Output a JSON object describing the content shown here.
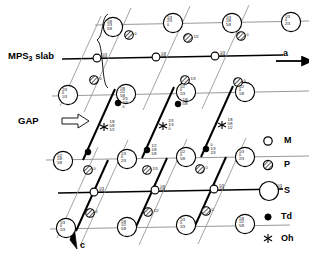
{
  "figure": {
    "kind": "crystal-structure-projection",
    "annotations": {
      "slab_label": "MPS",
      "slab_label_sub": "3",
      "slab_label_tail": " slab",
      "gap_label": "GAP",
      "gap_arrow": "⟹",
      "axis_a": "a",
      "axis_c": "c"
    },
    "legend": {
      "title": "",
      "items": [
        {
          "key": "M",
          "label": "M",
          "symbol": "small-open-circle"
        },
        {
          "key": "P",
          "label": "P",
          "symbol": "hatched-circle"
        },
        {
          "key": "S",
          "label": "S",
          "symbol": "large-open-circle"
        },
        {
          "key": "Td",
          "label": "Td",
          "symbol": "small-filled-dot"
        },
        {
          "key": "Oh",
          "label": "Oh",
          "symbol": "asterisk"
        }
      ]
    },
    "colors": {
      "ink": "#000000",
      "paper": "#ffffff",
      "grid_light": "#8a8a8a",
      "grid_heavy": "#000000"
    },
    "sites": {
      "S_large": [
        {
          "id": "S1",
          "x": 113,
          "y": 27,
          "lines": [
            "1/8",
            "1/3",
            "5/8"
          ]
        },
        {
          "id": "S2",
          "x": 173,
          "y": 23,
          "lines": [
            "1/3",
            "2/3",
            "0"
          ]
        },
        {
          "id": "S3",
          "x": 232,
          "y": 23,
          "lines": [
            "1/3",
            "1/8",
            "5/8"
          ]
        },
        {
          "id": "S4",
          "x": 291,
          "y": 22,
          "lines": [
            "1/3",
            "0",
            "2/3"
          ]
        },
        {
          "id": "S5",
          "x": 68,
          "y": 95,
          "lines": [
            "2/3",
            "0",
            "1/3"
          ]
        },
        {
          "id": "S6",
          "x": 126,
          "y": 94,
          "lines": [
            "1/8",
            "1/2",
            "5/8"
          ]
        },
        {
          "id": "S7",
          "x": 186,
          "y": 92,
          "lines": [
            "1/2",
            "0",
            "2/3"
          ]
        },
        {
          "id": "S8",
          "x": 245,
          "y": 92,
          "lines": [
            "1/2",
            "0",
            "1/8"
          ]
        },
        {
          "id": "S9",
          "x": 63,
          "y": 161,
          "lines": [
            "1/2",
            "1/8",
            "5/8"
          ]
        },
        {
          "id": "S10",
          "x": 127,
          "y": 159,
          "lines": [
            "1/3",
            "0",
            "2/3"
          ]
        },
        {
          "id": "S11",
          "x": 186,
          "y": 157,
          "lines": [
            "1/2",
            "0",
            "5/8"
          ]
        },
        {
          "id": "S12",
          "x": 245,
          "y": 157,
          "lines": [
            "1/3",
            "0",
            "2/3"
          ]
        },
        {
          "id": "S13",
          "x": 66,
          "y": 228,
          "lines": [
            "1/3",
            "0",
            "2/3"
          ]
        },
        {
          "id": "S14",
          "x": 127,
          "y": 227,
          "lines": [
            "1/8",
            "1/2",
            "5/8"
          ]
        },
        {
          "id": "S15",
          "x": 186,
          "y": 225,
          "lines": [
            "1/3",
            "0",
            "2/3"
          ]
        },
        {
          "id": "S16",
          "x": 245,
          "y": 224,
          "lines": [
            "1/8",
            "1/2",
            "5/8"
          ]
        }
      ],
      "M_small": [
        {
          "id": "M1",
          "x": 97,
          "y": 58,
          "lines": [
            "1/3",
            "2/3"
          ]
        },
        {
          "id": "M2",
          "x": 156,
          "y": 57,
          "lines": [
            "1/8",
            "5/8"
          ]
        },
        {
          "id": "M3",
          "x": 215,
          "y": 56,
          "lines": [
            "1/3",
            "2/3"
          ]
        },
        {
          "id": "M4",
          "x": 94,
          "y": 192,
          "lines": [
            "1/3",
            "2/3"
          ]
        },
        {
          "id": "M5",
          "x": 155,
          "y": 190,
          "lines": [
            "1/8",
            "5/8"
          ]
        },
        {
          "id": "M6",
          "x": 214,
          "y": 189,
          "lines": [
            "1/3",
            "2/3"
          ]
        },
        {
          "id": "M7",
          "x": 272,
          "y": 189,
          "lines": [
            "1/3",
            "5/3"
          ]
        }
      ],
      "P_hatched": [
        {
          "id": "P1",
          "x": 129,
          "y": 35,
          "lines": [
            "0"
          ]
        },
        {
          "id": "P2",
          "x": 188,
          "y": 38,
          "lines": [
            "1/2"
          ]
        },
        {
          "id": "P3",
          "x": 241,
          "y": 36,
          "lines": [
            "0"
          ]
        },
        {
          "id": "P4",
          "x": 94,
          "y": 80,
          "lines": [
            "0"
          ]
        },
        {
          "id": "P5",
          "x": 185,
          "y": 80,
          "lines": [
            "1/3"
          ]
        },
        {
          "id": "P6",
          "x": 238,
          "y": 82,
          "lines": [
            "0"
          ]
        },
        {
          "id": "P7",
          "x": 88,
          "y": 170,
          "lines": [
            "0"
          ]
        },
        {
          "id": "P8",
          "x": 147,
          "y": 170,
          "lines": [
            "1/3"
          ]
        },
        {
          "id": "P9",
          "x": 200,
          "y": 169,
          "lines": [
            "0"
          ]
        },
        {
          "id": "P10",
          "x": 90,
          "y": 213,
          "lines": [
            "0"
          ]
        },
        {
          "id": "P11",
          "x": 148,
          "y": 212,
          "lines": [
            "1/2"
          ]
        },
        {
          "id": "P12",
          "x": 206,
          "y": 211,
          "lines": [
            "0"
          ]
        }
      ],
      "Td_dots": [
        {
          "id": "Td1",
          "x": 118,
          "y": 103,
          "lines": [
            "2/3",
            "1/3",
            "0"
          ]
        },
        {
          "id": "Td2",
          "x": 178,
          "y": 104,
          "lines": [
            "1/8",
            "5/8"
          ]
        },
        {
          "id": "Td3",
          "x": 88,
          "y": 152,
          "lines": [
            ""
          ]
        },
        {
          "id": "Td4",
          "x": 147,
          "y": 150,
          "lines": [
            "1/2",
            "1/8",
            "5/8"
          ]
        },
        {
          "id": "Td5",
          "x": 206,
          "y": 149,
          "lines": [
            "0",
            "1/3",
            "2/3"
          ]
        }
      ],
      "Oh_stars": [
        {
          "id": "Oh1",
          "x": 104,
          "y": 127,
          "lines": [
            "1/8",
            "5/8",
            "1/2"
          ]
        },
        {
          "id": "Oh2",
          "x": 163,
          "y": 126,
          "lines": [
            "2/3",
            "1/3",
            "0"
          ]
        },
        {
          "id": "Oh3",
          "x": 222,
          "y": 125,
          "lines": [
            "1/8",
            "5/8",
            "1/2"
          ]
        }
      ]
    }
  }
}
